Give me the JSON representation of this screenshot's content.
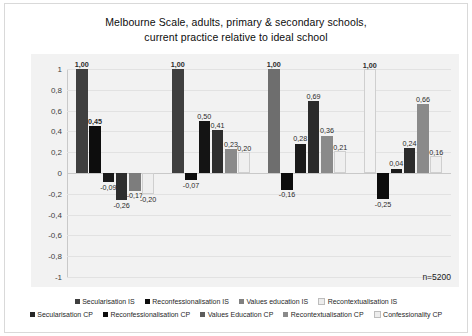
{
  "chart_data": {
    "type": "bar",
    "title": "Melbourne Scale, adults, primary & secondary schools, current practice relative to ideal school",
    "title_line1": "Melbourne Scale, adults, primary & secondary schools,",
    "title_line2": "current practice relative to ideal school",
    "xlabel": "",
    "ylabel": "",
    "ylim": [
      -1,
      1
    ],
    "grid": true,
    "legend_position": "bottom",
    "annotation": "n=5200",
    "yticks": [
      "1",
      "0,8",
      "0,6",
      "0,4",
      "0,2",
      "0",
      "-0,2",
      "-0,4",
      "-0,6",
      "-0,8",
      "-1"
    ],
    "ytick_values": [
      1,
      0.8,
      0.6,
      0.4,
      0.2,
      0,
      -0.2,
      -0.4,
      -0.6,
      -0.8,
      -1
    ],
    "categories": [
      "Secularisation",
      "Reconfessionalisation",
      "Values education",
      "Recontextualisation"
    ],
    "series": [
      {
        "name": "Secularisation IS",
        "color": "#3f3f3f",
        "values": [
          1.0,
          1.0,
          1.0,
          1.0
        ],
        "labels": [
          "1,00",
          "1,00",
          "1,00",
          "1,00"
        ]
      },
      {
        "name": "Reconfessionalisation IS",
        "color": "#0d0d0d",
        "values": [
          0.45,
          -0.07,
          -0.16,
          -0.25
        ],
        "labels": [
          "0,45",
          "-0,07",
          "-0,16",
          "-0,25"
        ]
      },
      {
        "name": "Values education IS",
        "color": "#808080",
        "values": [
          -0.09,
          0.5,
          0.28,
          0.04
        ],
        "labels": [
          "-0,09",
          "0,50",
          "0,28",
          "0,04"
        ]
      },
      {
        "name": "Recontextualisation IS",
        "color": "#ededed",
        "values": [
          -0.26,
          0.41,
          0.69,
          0.24
        ],
        "labels": [
          "-0,26",
          "0,41",
          "0,69",
          "0,24"
        ]
      },
      {
        "name": "Secularisation CP",
        "color": "#262626",
        "values": [
          -0.17,
          0.23,
          0.36,
          0.66
        ],
        "labels": [
          "-0,17",
          "0,23",
          "0,36",
          "0,66"
        ]
      },
      {
        "name": "Reconfessionalisation CP",
        "color": "#d9d9d9",
        "values": [
          -0.2,
          0.2,
          0.21,
          0.16
        ],
        "labels": [
          "-0,20",
          "0,20",
          "0,21",
          "0,16"
        ]
      }
    ],
    "groups": [
      {
        "bars": [
          {
            "value": 1.0,
            "label": "1,00",
            "color": "#3f3f3f",
            "bold": true
          },
          {
            "value": 0.45,
            "label": "0,45",
            "color": "#0d0d0d",
            "bold": true
          },
          {
            "value": -0.09,
            "label": "-0,09",
            "color": "#1a1a1a",
            "bold": false
          },
          {
            "value": -0.26,
            "label": "-0,26",
            "color": "#2e2e2e",
            "bold": false
          },
          {
            "value": -0.17,
            "label": "-0,17",
            "color": "#7d7d7d",
            "bold": false
          },
          {
            "value": -0.2,
            "label": "-0,20",
            "color": "#efefef",
            "bold": false
          }
        ]
      },
      {
        "bars": [
          {
            "value": 1.0,
            "label": "1,00",
            "color": "#3f3f3f",
            "bold": true
          },
          {
            "value": -0.07,
            "label": "-0,07",
            "color": "#0d0d0d",
            "bold": false
          },
          {
            "value": 0.5,
            "label": "0,50",
            "color": "#141414",
            "bold": false
          },
          {
            "value": 0.41,
            "label": "0,41",
            "color": "#2e2e2e",
            "bold": false
          },
          {
            "value": 0.23,
            "label": "0,23",
            "color": "#8a8a8a",
            "bold": false
          },
          {
            "value": 0.2,
            "label": "0,20",
            "color": "#efefef",
            "bold": false
          }
        ]
      },
      {
        "bars": [
          {
            "value": 1.0,
            "label": "1,00",
            "color": "#6e6e6e",
            "bold": true
          },
          {
            "value": -0.16,
            "label": "-0,16",
            "color": "#0d0d0d",
            "bold": false
          },
          {
            "value": 0.28,
            "label": "0,28",
            "color": "#1a1a1a",
            "bold": false
          },
          {
            "value": 0.69,
            "label": "0,69",
            "color": "#2b2b2b",
            "bold": false
          },
          {
            "value": 0.36,
            "label": "0,36",
            "color": "#8a8a8a",
            "bold": false
          },
          {
            "value": 0.21,
            "label": "0,21",
            "color": "#efefef",
            "bold": false
          }
        ]
      },
      {
        "bars": [
          {
            "value": 1.0,
            "label": "1,00",
            "color": "#f2f2f2",
            "bold": true
          },
          {
            "value": -0.25,
            "label": "-0,25",
            "color": "#0d0d0d",
            "bold": false
          },
          {
            "value": 0.04,
            "label": "0,04",
            "color": "#1a1a1a",
            "bold": false
          },
          {
            "value": 0.24,
            "label": "0,24",
            "color": "#2b2b2b",
            "bold": false
          },
          {
            "value": 0.66,
            "label": "0,66",
            "color": "#8a8a8a",
            "bold": false
          },
          {
            "value": 0.16,
            "label": "0,16",
            "color": "#efefef",
            "bold": false
          }
        ]
      }
    ],
    "legend": {
      "row1": [
        {
          "label": "Secularisation IS",
          "color": "#3f3f3f"
        },
        {
          "label": "Reconfessionalisation IS",
          "color": "#0d0d0d"
        },
        {
          "label": "Values education IS",
          "color": "#808080"
        },
        {
          "label": "Recontextualisation IS",
          "color": "#ededed"
        }
      ],
      "row2": [
        {
          "label": "Secularisation CP",
          "color": "#262626"
        },
        {
          "label": "Reconfessionalisation CP",
          "color": "#0d0d0d"
        },
        {
          "label": "Values Education CP",
          "color": "#5c5c5c"
        },
        {
          "label": "Recontextualisation CP",
          "color": "#8a8a8a"
        },
        {
          "label": "Confessionality CP",
          "color": "#ededed"
        }
      ]
    }
  }
}
